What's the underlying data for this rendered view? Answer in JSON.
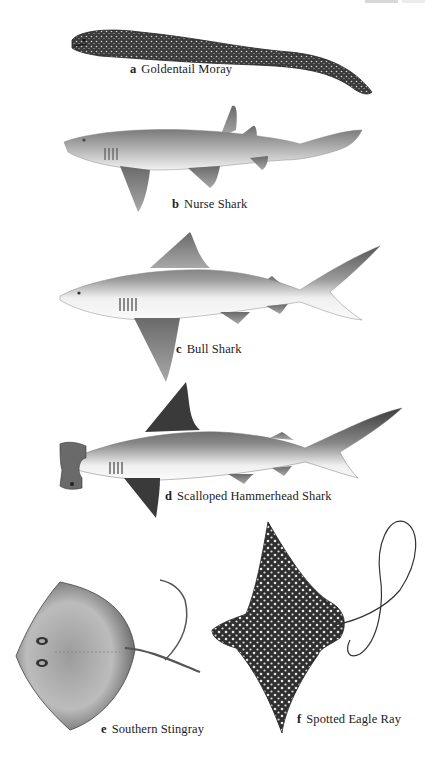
{
  "plate": {
    "figures": [
      {
        "letter": "a",
        "name": "Goldentail Moray"
      },
      {
        "letter": "b",
        "name": "Nurse Shark"
      },
      {
        "letter": "c",
        "name": "Bull Shark"
      },
      {
        "letter": "d",
        "name": "Scalloped Hammerhead Shark"
      },
      {
        "letter": "e",
        "name": "Southern Stingray"
      },
      {
        "letter": "f",
        "name": "Spotted Eagle Ray"
      }
    ]
  },
  "colors": {
    "caption": "#222222",
    "background": "#ffffff"
  }
}
